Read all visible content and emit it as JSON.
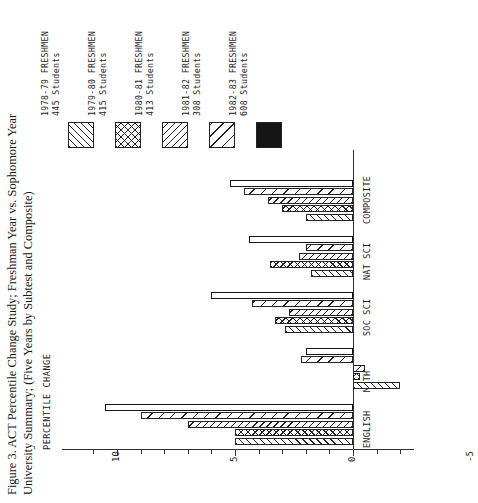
{
  "figure": {
    "title_line_1": "Figure 3. ACT Percentile Change Study; Freshman Year vs. Sophomore Year",
    "title_line_2": "University Summary; (Five Years by Subtest and Composite)"
  },
  "axis": {
    "value_axis_title": "PERCENTILE CHANGE",
    "tick_labels": [
      "10",
      "5",
      "0",
      "-5"
    ],
    "tick_values": [
      10,
      5,
      0,
      -5
    ]
  },
  "legend": {
    "entries": [
      {
        "label_line_1": "1978-79 FRESHMEN",
        "label_line_2": "445 Students",
        "pattern": "diagonal-right-hatch"
      },
      {
        "label_line_1": "1979-80 FRESHMEN",
        "label_line_2": "415 Students",
        "pattern": "cross-hatch"
      },
      {
        "label_line_1": "1980-81 FRESHMEN",
        "label_line_2": "413 Students",
        "pattern": "diagonal-left-hatch"
      },
      {
        "label_line_1": "1981-82 FRESHMEN",
        "label_line_2": "308 Students",
        "pattern": "diagonal-wide-hatch"
      },
      {
        "label_line_1": "1982-83 FRESHMEN",
        "label_line_2": "608 Students",
        "pattern": "solid-black"
      }
    ]
  },
  "chart_data": {
    "type": "bar",
    "orientation": "horizontal",
    "title": "Figure 3. ACT Percentile Change Study; Freshman Year vs. Sophomore Year University Summary; (Five Years by Subtest and Composite)",
    "xlabel": "PERCENTILE CHANGE",
    "ylabel": "",
    "xlim": [
      -5,
      11
    ],
    "grid": false,
    "legend_position": "top-left",
    "categories": [
      "ENGLISH",
      "MATH",
      "SOC SCI",
      "NAT SCI",
      "COMPOSITE"
    ],
    "series": [
      {
        "name": "1978-79 FRESHMEN 445 Students",
        "pattern": "diagonal-right-hatch",
        "values": [
          5.0,
          -2.0,
          2.9,
          1.8,
          2.0
        ]
      },
      {
        "name": "1979-80 FRESHMEN 415 Students",
        "pattern": "cross-hatch",
        "values": [
          5.0,
          -0.3,
          3.3,
          3.5,
          3.0
        ]
      },
      {
        "name": "1980-81 FRESHMEN 413 Students",
        "pattern": "diagonal-left-hatch",
        "values": [
          7.0,
          -0.5,
          2.7,
          2.3,
          3.6
        ]
      },
      {
        "name": "1981-82 FRESHMEN 308 Students",
        "pattern": "diagonal-wide-hatch",
        "values": [
          9.0,
          2.2,
          4.3,
          2.0,
          4.6
        ]
      },
      {
        "name": "1982-83 FRESHMEN 608 Students",
        "pattern": "solid-black",
        "values": [
          10.5,
          2.0,
          6.0,
          4.4,
          5.2
        ]
      }
    ]
  }
}
